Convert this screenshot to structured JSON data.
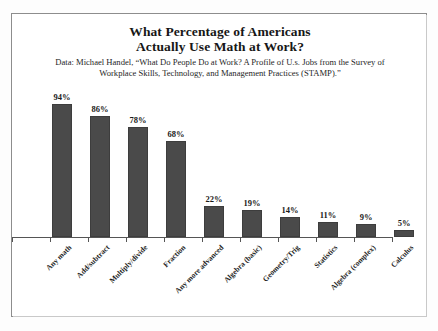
{
  "chart_data": {
    "type": "bar",
    "title": "What Percentage of Americans Actually Use Math at Work?",
    "title_line1": "What Percentage of Americans",
    "title_line2": "Actually Use Math at Work?",
    "subtitle": "Data: Michael Handel, “What Do People Do at Work? A Profile of U.s. Jobs from the Survey of Workplace Skills, Technology, and Management Practices (STAMP).”",
    "categories": [
      "Any math",
      "Add/subtract",
      "Multiply/divide",
      "Fraction",
      "Any more advanced",
      "Algebra (basic)",
      "Geometry/Trig",
      "Statistics",
      "Algebra (complex)",
      "Calculus"
    ],
    "values": [
      94,
      86,
      78,
      68,
      22,
      19,
      14,
      11,
      9,
      5
    ],
    "value_labels": [
      "94%",
      "86%",
      "78%",
      "68%",
      "22%",
      "19%",
      "14%",
      "11%",
      "9%",
      "5%"
    ],
    "xlabel": "",
    "ylabel": "",
    "ylim": [
      0,
      100
    ],
    "grid": false,
    "legend": false,
    "bar_color": "#4a4a4a",
    "axis_color": "#555555",
    "background": "#ffffff",
    "frame_color": "#8d8d8d"
  }
}
